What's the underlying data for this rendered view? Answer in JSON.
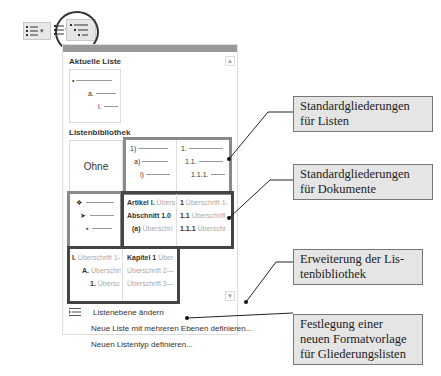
{
  "ribbon": {
    "bullets_icon": "bullet-list-icon",
    "numbering_icon": "numbered-list-icon",
    "multilevel_icon": "multilevel-list-icon"
  },
  "panel": {
    "current_list": {
      "heading": "Aktuelle Liste",
      "levels": [
        "•",
        "a.",
        "i."
      ]
    },
    "library": {
      "heading": "Listenbibliothek",
      "none_label": "Ohne",
      "lists_group": [
        {
          "levels": [
            "1)",
            "a)",
            "i)"
          ]
        },
        {
          "levels": [
            "1.",
            "1.1.",
            "1.1.1."
          ]
        }
      ],
      "symbols_group": {
        "levels": [
          "❖",
          "➤",
          "▪"
        ]
      },
      "documents_group": [
        {
          "levels": [
            [
              "Artikel I.",
              "Übers"
            ],
            [
              "Abschnitt 1.0",
              ""
            ],
            [
              "(a)",
              "Überschri"
            ]
          ]
        },
        {
          "levels": [
            [
              "1",
              "Überschrift 1-"
            ],
            [
              "1.1",
              "Überschrift"
            ],
            [
              "1.1.1",
              "Überschr"
            ]
          ]
        }
      ],
      "extended_group": [
        {
          "levels": [
            [
              "I.",
              "Überschrift 1-"
            ],
            [
              "A.",
              "Überschri"
            ],
            [
              "1.",
              "Übersc"
            ]
          ]
        },
        {
          "levels": [
            [
              "Kapitel 1",
              "Über"
            ],
            [
              "",
              "Überschrift 2—"
            ],
            [
              "",
              "Überschrift 3—"
            ]
          ]
        }
      ]
    },
    "menu": [
      {
        "label": "Listenebene ändern",
        "icon": "change-list-level-icon"
      },
      {
        "label": "Neue Liste mit mehreren Ebenen definieren..."
      },
      {
        "label": "Neuen Listentyp definieren..."
      }
    ]
  },
  "callouts": [
    {
      "text": "Standardgliederungen für Listen"
    },
    {
      "text": "Standardgliederungen für Dokumente"
    },
    {
      "text": "Erweiterung der Lis-tenbibliothek"
    },
    {
      "text": "Festlegung einer neuen Formatvorlage für Gliederungslisten"
    }
  ],
  "callout_lines": {
    "c1": [
      "Standardgliederungen",
      "für Listen"
    ],
    "c2": [
      "Standardgliederungen",
      "für Dokumente"
    ],
    "c3": [
      "Erweiterung der Lis-",
      "tenbibliothek"
    ],
    "c4": [
      "Festlegung einer",
      "neuen Formatvorlage",
      "für Gliederungslisten"
    ]
  }
}
